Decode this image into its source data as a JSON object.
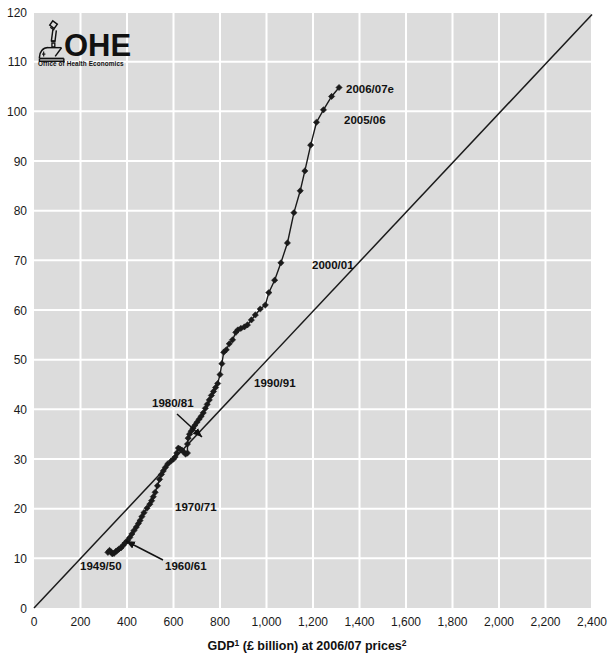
{
  "logo": {
    "name": "OHE",
    "tagline": "Office of Health Economics",
    "icon": "microscope-icon"
  },
  "chart_data": {
    "type": "scatter",
    "title": "",
    "subtitle": "",
    "xlabel_main": "GDP",
    "xlabel_sup1": "1",
    "xlabel_mid": " (£ billion) at 2006/07 prices",
    "xlabel_sup2": "2",
    "xlabel_full": "GDP¹ (£ billion) at 2006/07 prices²",
    "ylabel": "",
    "xlim": [
      0,
      2400
    ],
    "ylim": [
      0,
      120
    ],
    "xticks": [
      0,
      200,
      400,
      600,
      800,
      1000,
      1200,
      1400,
      1600,
      1800,
      2000,
      2200,
      2400
    ],
    "xticklabels": [
      "0",
      "200",
      "400",
      "600",
      "800",
      "1,000",
      "1,200",
      "1,400",
      "1,600",
      "1,800",
      "2,000",
      "2,200",
      "2,400"
    ],
    "yticks": [
      0,
      10,
      20,
      30,
      40,
      50,
      60,
      70,
      80,
      90,
      100,
      110,
      120
    ],
    "yticklabels": [
      "0",
      "10",
      "20",
      "30",
      "40",
      "50",
      "60",
      "70",
      "80",
      "90",
      "100",
      "110",
      "120"
    ],
    "grid": true,
    "grid_color": "#ffffff",
    "plot_bg": "#dcdcdc",
    "series": [
      {
        "name": "NHS expenditure vs GDP",
        "marker": "diamond",
        "marker_color": "#1a1a1a",
        "line_color": "#1a1a1a",
        "points": [
          [
            318,
            11.2
          ],
          [
            325,
            11.6
          ],
          [
            331,
            11.3
          ],
          [
            337,
            10.9
          ],
          [
            344,
            11.0
          ],
          [
            352,
            11.4
          ],
          [
            359,
            11.6
          ],
          [
            366,
            11.9
          ],
          [
            374,
            12.1
          ],
          [
            383,
            12.6
          ],
          [
            392,
            13.1
          ],
          [
            402,
            13.6
          ],
          [
            412,
            14.2
          ],
          [
            421,
            14.9
          ],
          [
            430,
            15.6
          ],
          [
            440,
            16.3
          ],
          [
            449,
            17.0
          ],
          [
            456,
            17.6
          ],
          [
            464,
            18.4
          ],
          [
            473,
            19.2
          ],
          [
            486,
            20.1
          ],
          [
            498,
            20.9
          ],
          [
            506,
            21.6
          ],
          [
            513,
            22.4
          ],
          [
            521,
            23.3
          ],
          [
            531,
            24.6
          ],
          [
            540,
            25.9
          ],
          [
            548,
            26.9
          ],
          [
            556,
            27.6
          ],
          [
            565,
            28.3
          ],
          [
            575,
            29.0
          ],
          [
            590,
            29.6
          ],
          [
            600,
            30.0
          ],
          [
            607,
            30.4
          ],
          [
            614,
            31.2
          ],
          [
            621,
            32.2
          ],
          [
            628,
            32.0
          ],
          [
            636,
            31.8
          ],
          [
            644,
            31.4
          ],
          [
            652,
            31.0
          ],
          [
            660,
            31.2
          ],
          [
            660,
            33.0
          ],
          [
            663,
            34.2
          ],
          [
            669,
            35.0
          ],
          [
            676,
            35.6
          ],
          [
            684,
            36.2
          ],
          [
            692,
            36.8
          ],
          [
            701,
            37.4
          ],
          [
            710,
            38.0
          ],
          [
            719,
            38.6
          ],
          [
            728,
            39.3
          ],
          [
            737,
            40.2
          ],
          [
            745,
            41.0
          ],
          [
            754,
            41.9
          ],
          [
            763,
            42.8
          ],
          [
            772,
            43.6
          ],
          [
            781,
            44.4
          ],
          [
            790,
            45.2
          ],
          [
            800,
            47.0
          ],
          [
            808,
            49.2
          ],
          [
            816,
            51.5
          ],
          [
            827,
            52.0
          ],
          [
            840,
            53.2
          ],
          [
            854,
            54.0
          ],
          [
            868,
            55.5
          ],
          [
            877,
            56.0
          ],
          [
            890,
            56.3
          ],
          [
            905,
            56.6
          ],
          [
            918,
            57.0
          ],
          [
            935,
            58.0
          ],
          [
            952,
            59.0
          ],
          [
            973,
            60.2
          ],
          [
            995,
            61.0
          ],
          [
            1010,
            63.5
          ],
          [
            1035,
            66.0
          ],
          [
            1062,
            69.5
          ],
          [
            1090,
            73.5
          ],
          [
            1118,
            79.6
          ],
          [
            1145,
            84.0
          ],
          [
            1165,
            88.0
          ],
          [
            1190,
            93.2
          ],
          [
            1215,
            97.8
          ],
          [
            1245,
            100.3
          ],
          [
            1280,
            103.0
          ],
          [
            1312,
            104.8
          ]
        ]
      }
    ],
    "reference_line": {
      "name": "45-degree reference line",
      "from": [
        0,
        0
      ],
      "to": [
        2400,
        119.5
      ],
      "color": "#1a1a1a"
    },
    "annotations": [
      {
        "id": "a1949",
        "text": "1949/50",
        "x_px": 80,
        "y_px": 570,
        "arrow": false
      },
      {
        "id": "a1960",
        "text": "1960/61",
        "x_px": 165,
        "y_px": 570,
        "arrow": true,
        "arrow_from": [
          163,
          560
        ],
        "arrow_to": [
          126,
          541
        ]
      },
      {
        "id": "a1970",
        "text": "1970/71",
        "x_px": 175,
        "y_px": 511,
        "arrow": false
      },
      {
        "id": "a1980",
        "text": "1980/81",
        "x_px": 152,
        "y_px": 407,
        "arrow": true,
        "arrow_from": [
          177,
          414
        ],
        "arrow_to": [
          202,
          437
        ]
      },
      {
        "id": "a1990",
        "text": "1990/91",
        "x_px": 254,
        "y_px": 387,
        "arrow": false
      },
      {
        "id": "a2000",
        "text": "2000/01",
        "x_px": 312,
        "y_px": 269,
        "arrow": false
      },
      {
        "id": "a2005",
        "text": "2005/06",
        "x_px": 344,
        "y_px": 124,
        "arrow": false
      },
      {
        "id": "a2006",
        "text": "2006/07e",
        "x_px": 346,
        "y_px": 93,
        "arrow": false
      }
    ]
  }
}
